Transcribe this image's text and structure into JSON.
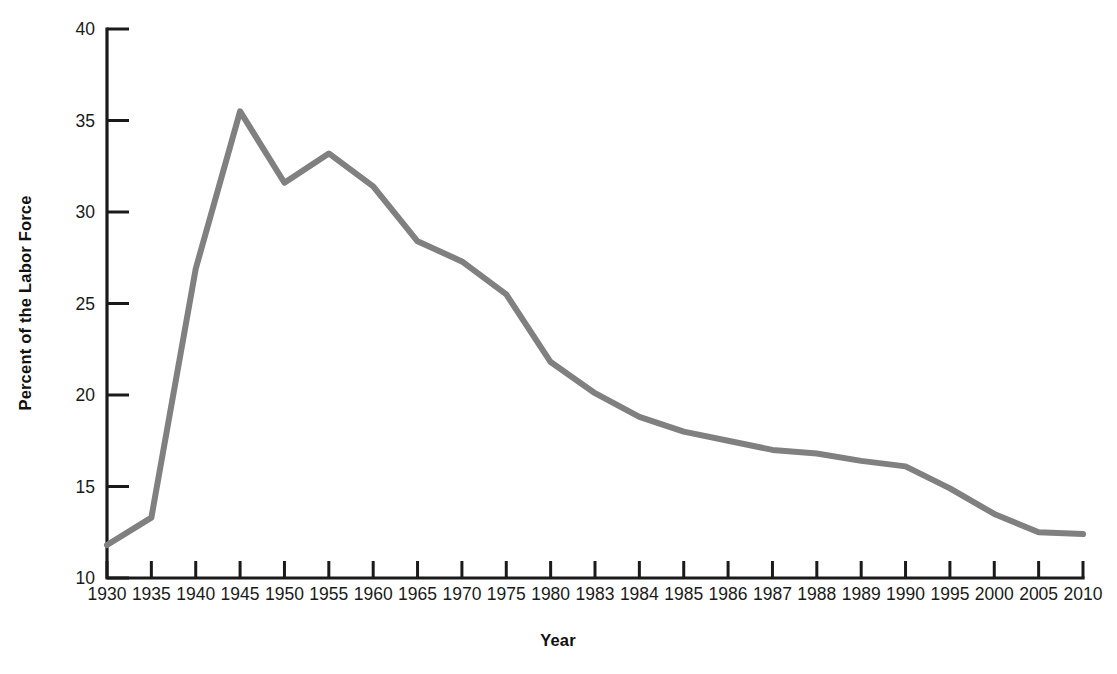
{
  "chart_data": {
    "type": "line",
    "title": "",
    "subtitle": "",
    "xlabel": "Year",
    "ylabel": "Percent of the Labor Force",
    "categories": [
      "1930",
      "1935",
      "1940",
      "1945",
      "1950",
      "1955",
      "1960",
      "1965",
      "1970",
      "1975",
      "1980",
      "1983",
      "1984",
      "1985",
      "1986",
      "1987",
      "1988",
      "1989",
      "1990",
      "1995",
      "2000",
      "2005",
      "2010"
    ],
    "values": [
      11.8,
      13.3,
      26.9,
      35.5,
      31.6,
      33.2,
      31.4,
      28.4,
      27.3,
      25.5,
      21.8,
      20.1,
      18.8,
      18.0,
      17.5,
      17.0,
      16.8,
      16.4,
      16.1,
      14.9,
      13.5,
      12.5,
      12.4
    ],
    "ylim": [
      10,
      40
    ],
    "yticks": [
      10,
      15,
      20,
      25,
      30,
      35,
      40
    ],
    "ytick_labels": [
      "10",
      "15",
      "20",
      "25",
      "30",
      "35",
      "40"
    ],
    "grid": false,
    "legend": null,
    "legend_position": "none",
    "annotations": [],
    "series_color": "#808080",
    "axis_color": "#1a1a1a",
    "background_color": "#ffffff"
  },
  "axes": {
    "x_axis_name": "Year",
    "y_axis_name": "Percent of the Labor Force"
  }
}
